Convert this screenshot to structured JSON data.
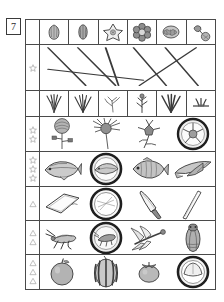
{
  "question": {
    "number": "7"
  },
  "markers": {
    "star_glyph": "star",
    "triangle_glyph": "triangle"
  },
  "rows": [
    {
      "id": "row-buds",
      "marker_type": "none",
      "marker_count": 0,
      "dividers": true,
      "columns": 6,
      "cells": [
        {
          "name": "bud-icon",
          "label": "flower bud"
        },
        {
          "name": "bud-closed-icon",
          "label": "closed bud"
        },
        {
          "name": "star-flower-icon",
          "label": "star shaped blossom"
        },
        {
          "name": "round-blossom-icon",
          "label": "round blossom cluster"
        },
        {
          "name": "ruffled-blossom-icon",
          "label": "ruffled blossom"
        },
        {
          "name": "double-blossom-icon",
          "label": "pair of blossoms"
        }
      ]
    },
    {
      "id": "row-lines",
      "marker_type": "star",
      "marker_count": 1,
      "dividers": false,
      "columns": 0,
      "cells": [],
      "note": "matching lines panel"
    },
    {
      "id": "row-grass",
      "marker_type": "none",
      "marker_count": 0,
      "dividers": true,
      "columns": 6,
      "cells": [
        {
          "name": "grass-tuft-icon",
          "label": "grass tuft"
        },
        {
          "name": "grass-blades-icon",
          "label": "grass blades"
        },
        {
          "name": "thin-sprig-icon",
          "label": "thin sprig"
        },
        {
          "name": "seedling-icon",
          "label": "seedling sprout"
        },
        {
          "name": "wide-grass-icon",
          "label": "wide grass"
        },
        {
          "name": "low-sprout-icon",
          "label": "low sprout"
        }
      ]
    },
    {
      "id": "row-flowers",
      "marker_type": "star",
      "marker_count": 2,
      "dividers": false,
      "columns": 4,
      "cells": [
        {
          "name": "pompom-flower-icon",
          "label": "pompom flower"
        },
        {
          "name": "spiky-flower-icon",
          "label": "spiky flower"
        },
        {
          "name": "stemmed-flower-icon",
          "label": "stemmed flower"
        },
        {
          "name": "flower-on-plate-icon",
          "label": "flower on plate"
        }
      ]
    },
    {
      "id": "row-fish",
      "marker_type": "star",
      "marker_count": 3,
      "dividers": false,
      "columns": 4,
      "cells": [
        {
          "name": "mackerel-icon",
          "label": "mackerel"
        },
        {
          "name": "fish-on-plate-icon",
          "label": "fish on plate"
        },
        {
          "name": "sea-bream-icon",
          "label": "sea bream"
        },
        {
          "name": "flying-fish-icon",
          "label": "flying fish"
        }
      ]
    },
    {
      "id": "row-tools",
      "marker_type": "triangle",
      "marker_count": 1,
      "dividers": false,
      "columns": 4,
      "cells": [
        {
          "name": "cutting-board-icon",
          "label": "cutting board"
        },
        {
          "name": "plate-icon",
          "label": "plate"
        },
        {
          "name": "kitchen-knife-icon",
          "label": "kitchen knife"
        },
        {
          "name": "chopsticks-icon",
          "label": "chopsticks"
        }
      ]
    },
    {
      "id": "row-insects",
      "marker_type": "triangle",
      "marker_count": 2,
      "dividers": false,
      "columns": 4,
      "cells": [
        {
          "name": "grasshopper-icon",
          "label": "grasshopper"
        },
        {
          "name": "insect-on-plate-icon",
          "label": "insect on plate"
        },
        {
          "name": "dragonfly-icon",
          "label": "dragonfly"
        },
        {
          "name": "cicada-icon",
          "label": "cicada"
        }
      ]
    },
    {
      "id": "row-fruit",
      "marker_type": "triangle",
      "marker_count": 3,
      "dividers": false,
      "columns": 4,
      "cells": [
        {
          "name": "apple-icon",
          "label": "apple"
        },
        {
          "name": "watermelon-icon",
          "label": "watermelon"
        },
        {
          "name": "persimmon-icon",
          "label": "persimmon"
        },
        {
          "name": "fruit-on-plate-icon",
          "label": "fruit on plate"
        }
      ]
    }
  ],
  "match_lines": [
    {
      "x1": 8,
      "y1": 6,
      "x2": 46,
      "y2": 92
    },
    {
      "x1": 38,
      "y1": 6,
      "x2": 76,
      "y2": 92
    },
    {
      "x1": 66,
      "y1": 6,
      "x2": 79,
      "y2": 92
    },
    {
      "x1": 94,
      "y1": 6,
      "x2": 127,
      "y2": 92
    },
    {
      "x1": 126,
      "y1": 6,
      "x2": 159,
      "y2": 92
    },
    {
      "x1": 8,
      "y1": 55,
      "x2": 104,
      "y2": 80
    },
    {
      "x1": 157,
      "y1": 6,
      "x2": 100,
      "y2": 92
    }
  ],
  "colors": {
    "ink": "#4a4a4a",
    "marker": "#777777",
    "line": "#3b3b3b",
    "background": "#ffffff"
  }
}
